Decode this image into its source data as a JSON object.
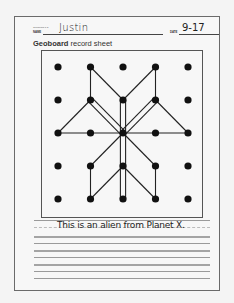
{
  "sheet": {
    "tiny_label": "Geoboard 1-5",
    "name_label": "NAME",
    "name_value": "Justin",
    "date_label": "DATE",
    "date_value": "9-17",
    "title_bold": "Geoboard",
    "title_rest": " record sheet"
  },
  "geoboard": {
    "rows": 5,
    "cols": 5,
    "peg_color": "#111111",
    "band_color": "#222222",
    "segments": [
      [
        [
          1,
          0
        ],
        [
          1,
          1
        ]
      ],
      [
        [
          1,
          0
        ],
        [
          2,
          1
        ]
      ],
      [
        [
          3,
          0
        ],
        [
          2,
          1
        ]
      ],
      [
        [
          3,
          0
        ],
        [
          3,
          1
        ]
      ],
      [
        [
          1,
          1
        ],
        [
          0,
          2
        ]
      ],
      [
        [
          3,
          1
        ],
        [
          4,
          2
        ]
      ],
      [
        [
          0,
          2
        ],
        [
          4,
          2
        ]
      ],
      [
        [
          2,
          2
        ],
        [
          1,
          3
        ]
      ],
      [
        [
          2,
          2
        ],
        [
          3,
          3
        ]
      ],
      [
        [
          1,
          3
        ],
        [
          1,
          4
        ]
      ],
      [
        [
          3,
          3
        ],
        [
          3,
          4
        ]
      ],
      [
        [
          1,
          4
        ],
        [
          2,
          3
        ]
      ],
      [
        [
          3,
          4
        ],
        [
          2,
          3
        ]
      ]
    ],
    "double_bands": [
      [
        [
          1,
          1
        ],
        [
          2,
          2
        ]
      ],
      [
        [
          3,
          1
        ],
        [
          2,
          2
        ]
      ],
      [
        [
          2,
          1
        ],
        [
          2,
          4
        ]
      ]
    ]
  },
  "writing": {
    "sentence": "This is an alien from Planet X."
  }
}
